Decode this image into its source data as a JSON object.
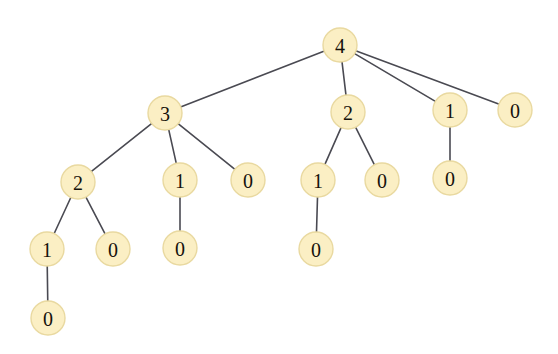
{
  "figure": {
    "background_color": "#ffffff",
    "node_fill": "#fbefc4",
    "node_stroke": "#e9d9a0",
    "edge_color": "#4a4a52",
    "label_color": "#16120b",
    "node_radius": 17,
    "width": 558,
    "height": 354
  },
  "chart_data": {
    "type": "diagram",
    "diagram_type": "tree",
    "node_count": 16,
    "edge_count": 15,
    "depth": 5,
    "nodes": [
      {
        "id": "n0",
        "label": "4",
        "x": 340,
        "y": 45,
        "depth": 0,
        "parent": null
      },
      {
        "id": "n1",
        "label": "3",
        "x": 165,
        "y": 113,
        "depth": 1,
        "parent": "n0"
      },
      {
        "id": "n2",
        "label": "2",
        "x": 348,
        "y": 112,
        "depth": 1,
        "parent": "n0"
      },
      {
        "id": "n3",
        "label": "1",
        "x": 450,
        "y": 110,
        "depth": 1,
        "parent": "n0"
      },
      {
        "id": "n4",
        "label": "0",
        "x": 515,
        "y": 110,
        "depth": 1,
        "parent": "n0"
      },
      {
        "id": "n5",
        "label": "2",
        "x": 78,
        "y": 182,
        "depth": 2,
        "parent": "n1"
      },
      {
        "id": "n6",
        "label": "1",
        "x": 180,
        "y": 180,
        "depth": 2,
        "parent": "n1"
      },
      {
        "id": "n7",
        "label": "0",
        "x": 248,
        "y": 180,
        "depth": 2,
        "parent": "n1"
      },
      {
        "id": "n8",
        "label": "1",
        "x": 318,
        "y": 180,
        "depth": 2,
        "parent": "n2"
      },
      {
        "id": "n9",
        "label": "0",
        "x": 382,
        "y": 180,
        "depth": 2,
        "parent": "n2"
      },
      {
        "id": "n10",
        "label": "0",
        "x": 450,
        "y": 178,
        "depth": 2,
        "parent": "n3"
      },
      {
        "id": "n11",
        "label": "1",
        "x": 47,
        "y": 249,
        "depth": 3,
        "parent": "n5"
      },
      {
        "id": "n12",
        "label": "0",
        "x": 113,
        "y": 249,
        "depth": 3,
        "parent": "n5"
      },
      {
        "id": "n13",
        "label": "0",
        "x": 180,
        "y": 248,
        "depth": 3,
        "parent": "n6"
      },
      {
        "id": "n14",
        "label": "0",
        "x": 316,
        "y": 249,
        "depth": 3,
        "parent": "n8"
      },
      {
        "id": "n15",
        "label": "0",
        "x": 48,
        "y": 318,
        "depth": 4,
        "parent": "n11"
      }
    ],
    "edges": [
      {
        "from": "n0",
        "to": "n1"
      },
      {
        "from": "n0",
        "to": "n2"
      },
      {
        "from": "n0",
        "to": "n3"
      },
      {
        "from": "n0",
        "to": "n4"
      },
      {
        "from": "n1",
        "to": "n5"
      },
      {
        "from": "n1",
        "to": "n6"
      },
      {
        "from": "n1",
        "to": "n7"
      },
      {
        "from": "n2",
        "to": "n8"
      },
      {
        "from": "n2",
        "to": "n9"
      },
      {
        "from": "n3",
        "to": "n10"
      },
      {
        "from": "n5",
        "to": "n11"
      },
      {
        "from": "n5",
        "to": "n12"
      },
      {
        "from": "n6",
        "to": "n13"
      },
      {
        "from": "n8",
        "to": "n14"
      },
      {
        "from": "n11",
        "to": "n15"
      }
    ]
  }
}
